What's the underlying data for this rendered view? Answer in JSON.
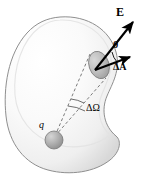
{
  "figure": {
    "background_color": "#ffffff",
    "width": 143,
    "height": 180,
    "labels": {
      "field_vector": "E",
      "angle": "θ",
      "area_element": "ΔA",
      "solid_angle": "ΔΩ",
      "charge": "q"
    },
    "colors": {
      "outline": "#8f8f8f",
      "surface_fill": "#f4f4f4",
      "surface_shade": "#dcdcdc",
      "patch_fill": "#b8b8b8",
      "patch_outline": "#6e6e6e",
      "charge_fill": "#a9a9a9",
      "charge_outline": "#6b6b6b",
      "arrow": "#000000",
      "dashed_line": "#5a5a5a"
    },
    "elements": {
      "closed_surface": "kidney-shaped closed gaussian surface, shaded light gray",
      "area_patch": "small tilted gray ellipse representing the area element on the surface",
      "field_arrow": "bold arrow pointing up-right labeled E",
      "normal_arrow": "shorter bold arrow from patch center pointing right-up labeled delta A",
      "angle_marker": "arc between E arrow and delta A arrow labeled theta",
      "cone_lines": "two dashed lines from the point charge to the edges of the area patch",
      "solid_angle_arc": "small arc near the charge apex labeled delta Omega",
      "point_charge": "shaded gray sphere labeled q"
    }
  }
}
